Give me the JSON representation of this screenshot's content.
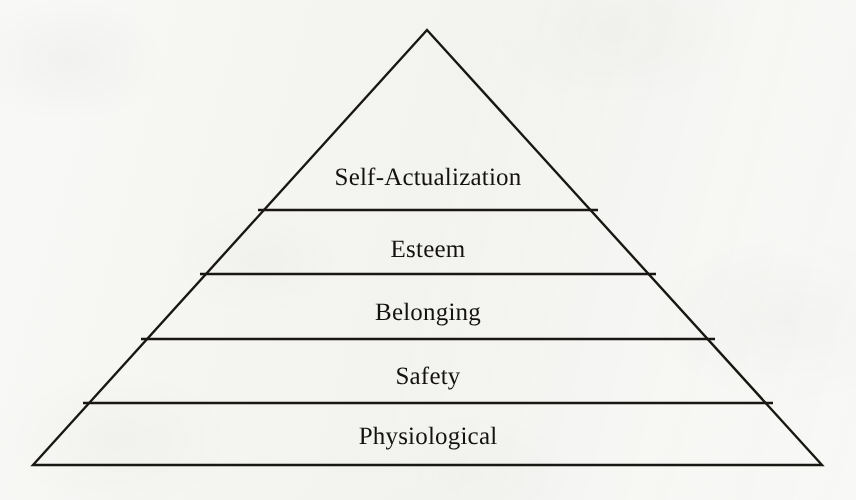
{
  "figure": {
    "name": "hierarchy-of-needs-pyramid",
    "type": "pyramid-diagram",
    "background_color": "#f8f8f6",
    "stroke_color": "#191714",
    "text_color": "#14120f",
    "apex": {
      "x": 427,
      "y": 30
    },
    "base_left": {
      "x": 33,
      "y": 465
    },
    "base_right": {
      "x": 822,
      "y": 465
    },
    "tiers": [
      {
        "label": "Self-Actualization",
        "rank": 5,
        "label_x": 428,
        "label_y": 178,
        "font_size": 25,
        "divider_y": 210,
        "divider_left_x": 258,
        "divider_right_x": 598
      },
      {
        "label": "Esteem",
        "rank": 4,
        "label_x": 428,
        "label_y": 250,
        "font_size": 25,
        "divider_y": 274,
        "divider_left_x": 200,
        "divider_right_x": 656
      },
      {
        "label": "Belonging",
        "rank": 3,
        "label_x": 428,
        "label_y": 313,
        "font_size": 25,
        "divider_y": 339,
        "divider_left_x": 141,
        "divider_right_x": 715
      },
      {
        "label": "Safety",
        "rank": 2,
        "label_x": 428,
        "label_y": 377,
        "font_size": 25,
        "divider_y": 403,
        "divider_left_x": 83,
        "divider_right_x": 773
      },
      {
        "label": "Physiological",
        "rank": 1,
        "label_x": 428,
        "label_y": 437,
        "font_size": 25,
        "divider_y": null,
        "divider_left_x": null,
        "divider_right_x": null
      }
    ]
  }
}
